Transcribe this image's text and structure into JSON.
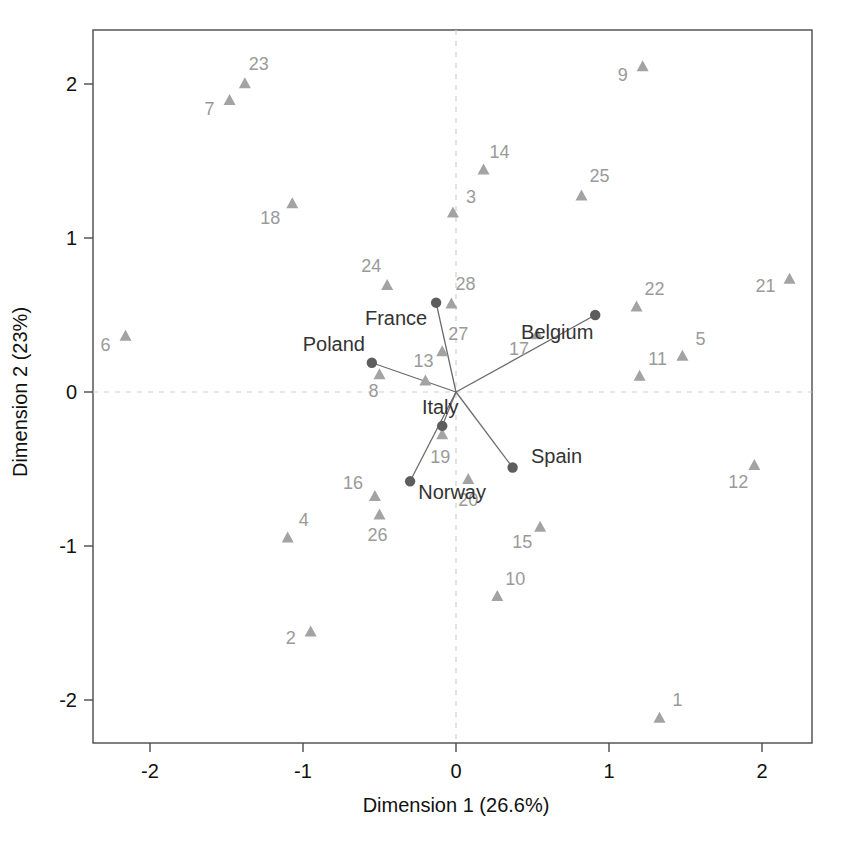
{
  "chart_data": {
    "type": "scatter",
    "title": "",
    "xlabel": "Dimension 1 (26.6%)",
    "ylabel": "Dimension 2 (23%)",
    "xlim": [
      -2.37,
      2.32
    ],
    "ylim": [
      -2.35,
      2.35
    ],
    "xticks": [
      "-2",
      "-1",
      "0",
      "1",
      "2"
    ],
    "xtick_values": [
      -2,
      -1,
      0,
      1,
      2
    ],
    "yticks": [
      "2",
      "1",
      "0",
      "-1",
      "-2"
    ],
    "ytick_values": [
      2,
      1,
      0,
      -1,
      -2
    ],
    "grid": false,
    "legend": "none",
    "zero_reference_lines": true,
    "series": [
      {
        "name": "categories",
        "marker": "triangle",
        "color": "#a3a3a3",
        "points": [
          {
            "label": "1",
            "x": 1.33,
            "y": -2.12,
            "label_dx": 18,
            "label_dy": -12
          },
          {
            "label": "2",
            "x": -0.95,
            "y": -1.56,
            "label_dx": -20,
            "label_dy": 12
          },
          {
            "label": "3",
            "x": -0.02,
            "y": 1.16,
            "label_dx": 18,
            "label_dy": -10
          },
          {
            "label": "4",
            "x": -1.1,
            "y": -0.95,
            "label_dx": 16,
            "label_dy": -12
          },
          {
            "label": "5",
            "x": 1.48,
            "y": 0.23,
            "label_dx": 18,
            "label_dy": -12
          },
          {
            "label": "6",
            "x": -2.16,
            "y": 0.36,
            "label_dx": -20,
            "label_dy": 14
          },
          {
            "label": "7",
            "x": -1.48,
            "y": 1.89,
            "label_dx": -20,
            "label_dy": 14
          },
          {
            "label": "8",
            "x": -0.5,
            "y": 0.11,
            "label_dx": -6,
            "label_dy": 22
          },
          {
            "label": "9",
            "x": 1.22,
            "y": 2.11,
            "label_dx": -20,
            "label_dy": 14
          },
          {
            "label": "10",
            "x": 0.27,
            "y": -1.33,
            "label_dx": 18,
            "label_dy": -12
          },
          {
            "label": "11",
            "x": 1.2,
            "y": 0.1,
            "label_dx": 18,
            "label_dy": -12
          },
          {
            "label": "12",
            "x": 1.95,
            "y": -0.48,
            "label_dx": -16,
            "label_dy": 22
          },
          {
            "label": "13",
            "x": -0.2,
            "y": 0.07,
            "label_dx": -2,
            "label_dy": -14
          },
          {
            "label": "14",
            "x": 0.18,
            "y": 1.44,
            "label_dx": 16,
            "label_dy": -12
          },
          {
            "label": "15",
            "x": 0.55,
            "y": -0.88,
            "label_dx": -18,
            "label_dy": 20
          },
          {
            "label": "16",
            "x": -0.53,
            "y": -0.68,
            "label_dx": -22,
            "label_dy": -8
          },
          {
            "label": "17",
            "x": 0.53,
            "y": 0.37,
            "label_dx": -18,
            "label_dy": 20
          },
          {
            "label": "18",
            "x": -1.07,
            "y": 1.22,
            "label_dx": -22,
            "label_dy": 20
          },
          {
            "label": "19",
            "x": -0.09,
            "y": -0.28,
            "label_dx": -2,
            "label_dy": 28
          },
          {
            "label": "20",
            "x": 0.08,
            "y": -0.57,
            "label_dx": 0,
            "label_dy": 26
          },
          {
            "label": "21",
            "x": 2.18,
            "y": 0.73,
            "label_dx": -24,
            "label_dy": 12
          },
          {
            "label": "22",
            "x": 1.18,
            "y": 0.55,
            "label_dx": 18,
            "label_dy": -12
          },
          {
            "label": "23",
            "x": -1.38,
            "y": 2.0,
            "label_dx": 14,
            "label_dy": -14
          },
          {
            "label": "24",
            "x": -0.45,
            "y": 0.69,
            "label_dx": -16,
            "label_dy": -14
          },
          {
            "label": "25",
            "x": 0.82,
            "y": 1.27,
            "label_dx": 18,
            "label_dy": -14
          },
          {
            "label": "26",
            "x": -0.5,
            "y": -0.8,
            "label_dx": -2,
            "label_dy": 26
          },
          {
            "label": "27",
            "x": -0.09,
            "y": 0.26,
            "label_dx": 16,
            "label_dy": -12
          },
          {
            "label": "28",
            "x": -0.03,
            "y": 0.57,
            "label_dx": 14,
            "label_dy": -14
          }
        ]
      },
      {
        "name": "countries",
        "marker": "dot",
        "color": "#5d5d5d",
        "connect_to_origin": true,
        "points": [
          {
            "label": "France",
            "x": -0.13,
            "y": 0.58,
            "label_dx": -40,
            "label_dy": 22,
            "anchor": "middle"
          },
          {
            "label": "Belgium",
            "x": 0.91,
            "y": 0.5,
            "label_dx": -38,
            "label_dy": 24,
            "anchor": "middle"
          },
          {
            "label": "Poland",
            "x": -0.55,
            "y": 0.19,
            "label_dx": -38,
            "label_dy": -12,
            "anchor": "middle"
          },
          {
            "label": "Italy",
            "x": -0.09,
            "y": -0.22,
            "label_dx": -2,
            "label_dy": -12,
            "anchor": "middle"
          },
          {
            "label": "Spain",
            "x": 0.37,
            "y": -0.49,
            "label_dx": 44,
            "label_dy": -4,
            "anchor": "middle"
          },
          {
            "label": "Norway",
            "x": -0.3,
            "y": -0.58,
            "label_dx": 42,
            "label_dy": 18,
            "anchor": "middle"
          }
        ]
      }
    ],
    "origin": {
      "x": 0,
      "y": 0
    }
  }
}
